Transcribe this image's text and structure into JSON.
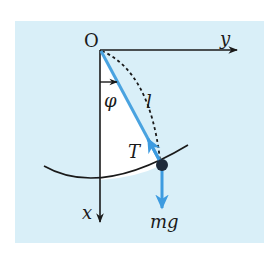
{
  "diagram": {
    "colors": {
      "panel": "#d9eff8",
      "white_region": "#ffffff",
      "axis": "#1a1a1a",
      "string": "#4aa3e0",
      "force": "#3d9be0",
      "bob": "#1e2a3a"
    },
    "labels": {
      "origin": "O",
      "y_axis": "y",
      "x_axis": "x",
      "angle": "φ",
      "length": "l",
      "tension": "T",
      "gravity": "mg"
    }
  }
}
